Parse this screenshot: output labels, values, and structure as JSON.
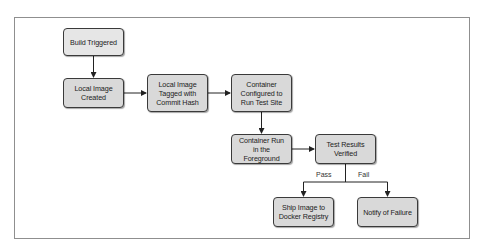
{
  "diagram": {
    "type": "flowchart",
    "nodes": [
      {
        "id": "build_triggered",
        "label": "Build Triggered"
      },
      {
        "id": "local_image_created",
        "label": "Local Image\nCreated"
      },
      {
        "id": "local_image_tagged",
        "label": "Local Image\nTagged with\nCommit Hash"
      },
      {
        "id": "container_configured",
        "label": "Container\nConfigured to\nRun Test Site"
      },
      {
        "id": "container_run",
        "label": "Container Run\nin the Foreground"
      },
      {
        "id": "test_results_verified",
        "label": "Test Results\nVerified"
      },
      {
        "id": "ship_image",
        "label": "Ship Image to\nDocker Registry"
      },
      {
        "id": "notify_failure",
        "label": "Notify of Failure"
      }
    ],
    "edges": [
      {
        "from": "build_triggered",
        "to": "local_image_created",
        "label": ""
      },
      {
        "from": "local_image_created",
        "to": "local_image_tagged",
        "label": ""
      },
      {
        "from": "local_image_tagged",
        "to": "container_configured",
        "label": ""
      },
      {
        "from": "container_configured",
        "to": "container_run",
        "label": ""
      },
      {
        "from": "container_run",
        "to": "test_results_verified",
        "label": ""
      },
      {
        "from": "test_results_verified",
        "to": "ship_image",
        "label": "Pass"
      },
      {
        "from": "test_results_verified",
        "to": "notify_failure",
        "label": "Fail"
      }
    ],
    "edge_labels": {
      "pass": "Pass",
      "fail": "Fail"
    },
    "colors": {
      "node_fill": "#d9d9d9",
      "start_node_fill": "#e6e6e6",
      "node_border": "#3a3a3a",
      "edge": "#222222",
      "frame_border": "#8f8f8f"
    }
  }
}
